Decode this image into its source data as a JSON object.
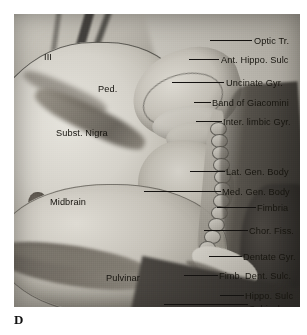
{
  "figure": {
    "letter": "D",
    "caption": ""
  },
  "plate": {
    "kind": "anatomical-photograph",
    "subject": "medial temporal lobe and midbrain dissection",
    "tones": {
      "background": "#9a9a96",
      "specimen_light": "#d8d6cf",
      "specimen_mid": "#a8a49b",
      "specimen_dark": "#2c2a27",
      "label_text": "#17150f",
      "leader_line": "#141210"
    }
  },
  "interior_labels": [
    {
      "id": "third-nerve",
      "text": "III",
      "x": 30,
      "y": 38
    },
    {
      "id": "peduncle",
      "text": "Ped.",
      "x": 84,
      "y": 70
    },
    {
      "id": "subst-nigra",
      "text": "Subst. Nigra",
      "x": 42,
      "y": 114
    },
    {
      "id": "midbrain",
      "text": "Midbrain",
      "x": 36,
      "y": 183
    },
    {
      "id": "pulvinar",
      "text": "Pulvinar",
      "x": 92,
      "y": 259
    },
    {
      "id": "crus-fornix",
      "text": "Crus Fornix",
      "x": 18,
      "y": 296
    }
  ],
  "leader_labels": [
    {
      "id": "optic-tr",
      "text": "Optic Tr.",
      "text_x": 240,
      "text_y": 22,
      "line_x": 196,
      "line_w": 42,
      "line_y": 26
    },
    {
      "id": "ant-hippo-sulc",
      "text": "Ant. Hippo. Sulc",
      "text_x": 207,
      "text_y": 41,
      "line_x": 175,
      "line_w": 30,
      "line_y": 45
    },
    {
      "id": "uncinate-gyr",
      "text": "Uncinate Gyr.",
      "text_x": 212,
      "text_y": 64,
      "line_x": 158,
      "line_w": 52,
      "line_y": 68
    },
    {
      "id": "band-giacomini",
      "text": "Band of Giacomini",
      "text_x": 198,
      "text_y": 84,
      "line_x": 180,
      "line_w": 17,
      "line_y": 88
    },
    {
      "id": "inter-limbic",
      "text": "Inter. limbic Gyr.",
      "text_x": 209,
      "text_y": 103,
      "line_x": 182,
      "line_w": 26,
      "line_y": 107
    },
    {
      "id": "lat-gen-body",
      "text": "Lat. Gen. Body",
      "text_x": 212,
      "text_y": 153,
      "line_x": 176,
      "line_w": 35,
      "line_y": 157
    },
    {
      "id": "med-gen-body",
      "text": "Med. Gen. Body",
      "text_x": 208,
      "text_y": 173,
      "line_x": 130,
      "line_w": 77,
      "line_y": 177
    },
    {
      "id": "fimbria",
      "text": "Fimbria",
      "text_x": 243,
      "text_y": 189,
      "line_x": 203,
      "line_w": 39,
      "line_y": 193
    },
    {
      "id": "chor-fiss",
      "text": "Chor. Fiss.",
      "text_x": 235,
      "text_y": 212,
      "line_x": 190,
      "line_w": 44,
      "line_y": 216
    },
    {
      "id": "dentate-gyr",
      "text": "Dentate Gyr.",
      "text_x": 229,
      "text_y": 238,
      "line_x": 195,
      "line_w": 33,
      "line_y": 242
    },
    {
      "id": "fimb-dent-sulc",
      "text": "Fimb. Dent. Sulc.",
      "text_x": 205,
      "text_y": 257,
      "line_x": 170,
      "line_w": 34,
      "line_y": 261
    },
    {
      "id": "hippo-sulc",
      "text": "Hippo. Sulc",
      "text_x": 231,
      "text_y": 277,
      "line_x": 206,
      "line_w": 24,
      "line_y": 281
    },
    {
      "id": "subiculum",
      "text": "Subiculum",
      "text_x": 235,
      "text_y": 290,
      "line_x": 150,
      "line_w": 84,
      "line_y": 290
    },
    {
      "id": "fasciolar-gyr",
      "text": "Fasciolar Gyr.",
      "text_x": 140,
      "text_y": 296,
      "line_x": 103,
      "line_w": 35,
      "line_y": 300
    }
  ],
  "beads": [
    {
      "x": 196,
      "y": 108
    },
    {
      "x": 197,
      "y": 120
    },
    {
      "x": 198,
      "y": 132
    },
    {
      "x": 199,
      "y": 144
    },
    {
      "x": 200,
      "y": 156
    },
    {
      "x": 200,
      "y": 168
    },
    {
      "x": 199,
      "y": 180
    },
    {
      "x": 197,
      "y": 192
    },
    {
      "x": 194,
      "y": 204
    },
    {
      "x": 190,
      "y": 216
    },
    {
      "x": 185,
      "y": 227
    }
  ]
}
